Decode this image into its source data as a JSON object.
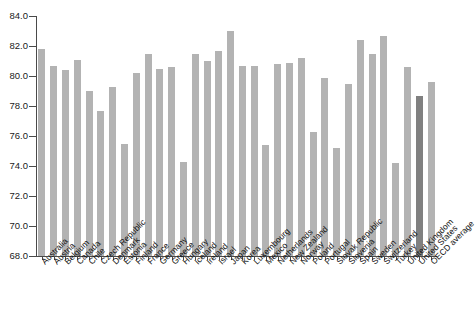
{
  "chart_data": {
    "type": "bar",
    "title": "",
    "xlabel": "",
    "ylabel": "",
    "ylim": [
      68.0,
      84.0
    ],
    "ytick_step": 2.0,
    "yticks": [
      "68.0",
      "70.0",
      "72.0",
      "74.0",
      "76.0",
      "78.0",
      "80.0",
      "82.0",
      "84.0"
    ],
    "grid": false,
    "legend": "none",
    "bar_color": "#b3b3b3",
    "highlight_color": "#808080",
    "highlight_category": "United States",
    "categories": [
      "Australia",
      "Austria",
      "Belgium",
      "Canada",
      "Chile",
      "Czech Republic",
      "Denmark",
      "Estonia",
      "Finland",
      "France",
      "Germany",
      "Greece",
      "Hungary",
      "Iceland",
      "Ireland",
      "Israel",
      "Japan",
      "Korea",
      "Luxembourg",
      "Mexico",
      "Netherlands",
      "New Zealand",
      "Norway",
      "Poland",
      "Portugal",
      "Slovak Republic",
      "Slovenia",
      "Spain",
      "Sweden",
      "Switzerland",
      "Turkey",
      "United Kingdom",
      "United States",
      "OECD average"
    ],
    "values": [
      81.8,
      80.7,
      80.4,
      81.1,
      79.0,
      77.7,
      79.3,
      75.5,
      80.2,
      81.5,
      80.5,
      80.6,
      74.3,
      81.5,
      81.0,
      81.7,
      83.0,
      80.7,
      80.7,
      75.4,
      80.8,
      80.9,
      81.2,
      76.3,
      79.9,
      75.2,
      79.5,
      82.4,
      81.5,
      82.7,
      74.2,
      80.6,
      78.7,
      79.6
    ]
  }
}
